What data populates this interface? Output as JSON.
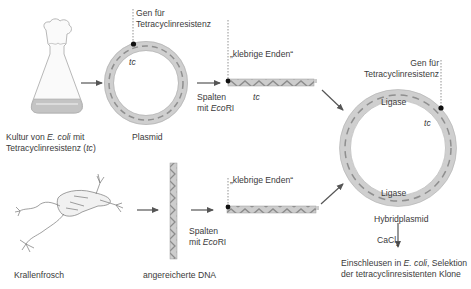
{
  "diagram": {
    "title": "",
    "nodes": {
      "culture": {
        "label_part1": "Kultur von ",
        "label_italic": "E. coli",
        "label_part2": " mit",
        "label_line2_part1": "Tetracyclinresistenz (",
        "label_line2_italic": "tc",
        "label_line2_part2": ")"
      },
      "plasmid": {
        "label": "Plasmid",
        "gene_label_line1": "Gen für",
        "gene_label_line2": "Tetracyclinresistenz",
        "gene_marker": "tc"
      },
      "cut_plasmid": {
        "sticky_ends_label": "„klebrige Enden“",
        "gene_marker": "tc"
      },
      "step_cut_top": {
        "line1": "Spalten",
        "line2_part1": "mit ",
        "line2_italic": "Eco",
        "line2_part2": "RI"
      },
      "frog": {
        "label": "Krallenfrosch"
      },
      "dna": {
        "label": "angereicherte DNA"
      },
      "step_cut_bottom": {
        "line1": "Spalten",
        "line2_part1": "mit ",
        "line2_italic": "Eco",
        "line2_part2": "RI"
      },
      "cut_dna": {
        "sticky_ends_label": "„klebrige Enden“"
      },
      "hybrid_plasmid": {
        "label": "Hybridplasmid",
        "gene_label_line1": "Gen für",
        "gene_label_line2": "Tetracyclinresistenz",
        "gene_marker": "tc",
        "ligase_top": "Ligase",
        "ligase_bottom": "Ligase"
      },
      "transformation": {
        "reagent": "CaCl",
        "reagent_subscript": "2",
        "line1_part1": "Einschleusen in ",
        "line1_italic": "E. coli",
        "line1_part2": ", Selektion",
        "line2": "der tetracyclinresistenten Klone"
      }
    },
    "edges": [
      {
        "from": "culture",
        "to": "plasmid"
      },
      {
        "from": "plasmid",
        "to": "cut_plasmid",
        "label": "Spalten mit EcoRI"
      },
      {
        "from": "cut_plasmid",
        "to": "hybrid_plasmid"
      },
      {
        "from": "frog",
        "to": "dna"
      },
      {
        "from": "dna",
        "to": "cut_dna",
        "label": "Spalten mit EcoRI"
      },
      {
        "from": "cut_dna",
        "to": "hybrid_plasmid"
      },
      {
        "from": "hybrid_plasmid",
        "to": "transformation",
        "label": "CaCl2"
      }
    ],
    "colors": {
      "dna_fill": "#c9c9c9",
      "dna_strand": "#8a8a8a",
      "arrow": "#555555",
      "text": "#3a3a3a"
    }
  }
}
